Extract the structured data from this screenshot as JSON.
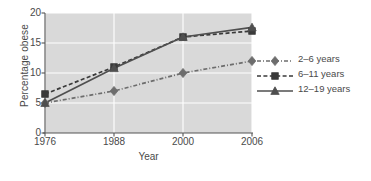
{
  "chart_data": {
    "type": "line",
    "title": "",
    "xlabel": "Year",
    "ylabel": "Percentage obese",
    "categories": [
      "1976",
      "1988",
      "2000",
      "2006"
    ],
    "xticklabels": [
      "1976",
      "1988",
      "2000",
      "2006"
    ],
    "yticklabels": [
      "0",
      "5",
      "10",
      "15",
      "20"
    ],
    "yticks": [
      0,
      5,
      10,
      15,
      20
    ],
    "ylim": [
      0,
      20
    ],
    "grid": true,
    "grid_color": "#ffffff",
    "plot_background": "#d9d9d9",
    "legend_position": "right",
    "series": [
      {
        "name": "2–6 years",
        "values": [
          5.0,
          7.0,
          10.0,
          12.0
        ],
        "marker": "diamond",
        "linestyle": "dash-dot",
        "color": "#6d6d6d"
      },
      {
        "name": "6–11 years",
        "values": [
          6.5,
          11.0,
          16.0,
          17.0
        ],
        "marker": "square",
        "linestyle": "dashed",
        "color": "#3a3a3a"
      },
      {
        "name": "12–19 years",
        "values": [
          5.0,
          10.8,
          16.0,
          17.6
        ],
        "marker": "triangle",
        "linestyle": "solid",
        "color": "#4f4f4f"
      }
    ]
  },
  "legend": {
    "items": [
      {
        "label": "2–6 years",
        "marker": "diamond-marker-icon",
        "linestyle": "dash-dot"
      },
      {
        "label": "6–11 years",
        "marker": "square-marker-icon",
        "linestyle": "dashed"
      },
      {
        "label": "12–19 years",
        "marker": "triangle-marker-icon",
        "linestyle": "solid"
      }
    ]
  },
  "caption": {
    "text": ""
  }
}
